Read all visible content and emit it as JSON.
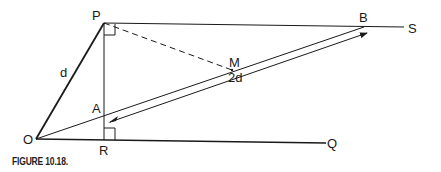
{
  "figure": {
    "caption": "FIGURE 10.18.",
    "points": {
      "P": {
        "label": "P",
        "x": 104,
        "y": 23
      },
      "O": {
        "label": "O",
        "x": 36,
        "y": 139
      },
      "R": {
        "label": "R",
        "x": 104,
        "y": 139
      },
      "A": {
        "label": "A",
        "x": 104,
        "y": 116
      },
      "B": {
        "label": "B",
        "x": 364,
        "y": 27
      },
      "M": {
        "label": "M",
        "x": 232,
        "y": 70
      },
      "S": {
        "label": "S",
        "x": 404,
        "y": 27
      },
      "Q": {
        "label": "Q",
        "x": 326,
        "y": 143
      }
    },
    "segment_labels": {
      "OP": "d",
      "arrow_length": "2d"
    },
    "colors": {
      "line": "#1a1a1a",
      "background": "#ffffff"
    }
  }
}
